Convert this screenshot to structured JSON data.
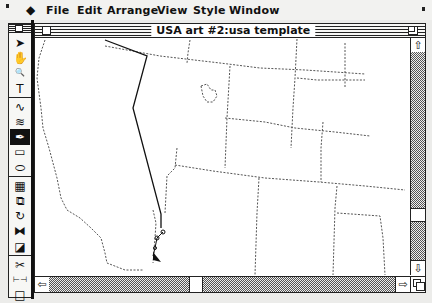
{
  "menubar": {
    "apple_icon": "apple-menu-icon",
    "items": [
      {
        "label": "File"
      },
      {
        "label": "Edit"
      },
      {
        "label": "Arrange"
      },
      {
        "label": "View"
      },
      {
        "label": "Style"
      },
      {
        "label": "Window"
      }
    ]
  },
  "palette": {
    "tools": [
      {
        "name": "arrow-tool",
        "glyph": "➤",
        "selected": false
      },
      {
        "name": "grabber-hand-tool",
        "glyph": "✋",
        "selected": false
      },
      {
        "name": "zoom-tool",
        "glyph": "🔍",
        "selected": false
      },
      {
        "name": "text-tool",
        "glyph": "T",
        "selected": false
      },
      {
        "name": "freehand-path-tool",
        "glyph": "∿",
        "selected": false
      },
      {
        "name": "autotrace-tool",
        "glyph": "≋",
        "selected": false
      },
      {
        "name": "pen-tool",
        "glyph": "✒",
        "selected": true
      },
      {
        "name": "rectangle-tool",
        "glyph": "▭",
        "selected": false
      },
      {
        "name": "oval-tool",
        "glyph": "⬭",
        "selected": false
      },
      {
        "name": "blend-tool",
        "glyph": "▦",
        "selected": false
      },
      {
        "name": "scale-tool",
        "glyph": "⧉",
        "selected": false
      },
      {
        "name": "rotate-tool",
        "glyph": "↻",
        "selected": false
      },
      {
        "name": "reflect-tool",
        "glyph": "⧓",
        "selected": false
      },
      {
        "name": "shear-tool",
        "glyph": "◪",
        "selected": false
      },
      {
        "name": "scissors-tool",
        "glyph": "✂",
        "selected": false
      },
      {
        "name": "measure-tool",
        "glyph": "⊢⊣",
        "selected": false
      },
      {
        "name": "page-tool",
        "glyph": "□",
        "selected": false
      }
    ]
  },
  "document": {
    "title": "USA art #2:usa template",
    "scroll": {
      "vertical_position": 0.8,
      "horizontal_position": 0.42
    }
  },
  "scrollbar": {
    "up_arrow": "⇧",
    "down_arrow": "⇩",
    "left_arrow": "⇦",
    "right_arrow": "⇨"
  }
}
